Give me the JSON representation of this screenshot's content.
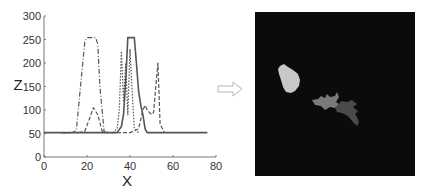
{
  "figure": {
    "arrow_icon": "right-arrow-icon",
    "image_panel": {
      "background": "#0b0b0b",
      "blobs": [
        {
          "name": "light-blob",
          "color": "#c8c8c8"
        },
        {
          "name": "mid-gray-blob",
          "color": "#7a7a7a"
        },
        {
          "name": "dark-gray-blob",
          "color": "#4a4a4a"
        }
      ]
    }
  },
  "chart_data": {
    "type": "line",
    "title": "",
    "xlabel": "X",
    "ylabel": "Z",
    "xlim": [
      0,
      80
    ],
    "ylim": [
      0,
      300
    ],
    "xticks": [
      0,
      20,
      40,
      60,
      80
    ],
    "yticks": [
      0,
      50,
      100,
      150,
      200,
      250,
      300
    ],
    "grid": false,
    "legend": null,
    "series": [
      {
        "name": "solid",
        "style": "solid",
        "x": [
          0,
          34,
          36,
          37,
          38,
          39,
          42,
          43,
          44,
          45,
          46,
          47,
          48,
          50,
          60,
          76
        ],
        "y": [
          52,
          52,
          65,
          90,
          160,
          254,
          254,
          200,
          140,
          110,
          90,
          60,
          52,
          52,
          52,
          52
        ]
      },
      {
        "name": "dash-dot",
        "style": "dashdot",
        "x": [
          8,
          12,
          15,
          17,
          19,
          20,
          24,
          25,
          26,
          28,
          30
        ],
        "y": [
          52,
          50,
          56,
          150,
          245,
          254,
          254,
          240,
          150,
          52,
          52
        ]
      },
      {
        "name": "dashed",
        "style": "dashed",
        "x": [
          16,
          19,
          21,
          23,
          25,
          27,
          30,
          40,
          44,
          46,
          47,
          48,
          50,
          51,
          52,
          53,
          54,
          56
        ],
        "y": [
          52,
          55,
          80,
          105,
          90,
          55,
          52,
          52,
          60,
          100,
          110,
          100,
          90,
          95,
          150,
          200,
          70,
          52
        ]
      },
      {
        "name": "dotted",
        "style": "dotted",
        "x": [
          32,
          34,
          35,
          36,
          37,
          38,
          39,
          40,
          41,
          42,
          44
        ],
        "y": [
          52,
          60,
          100,
          225,
          120,
          200,
          90,
          230,
          140,
          60,
          52
        ]
      }
    ]
  }
}
